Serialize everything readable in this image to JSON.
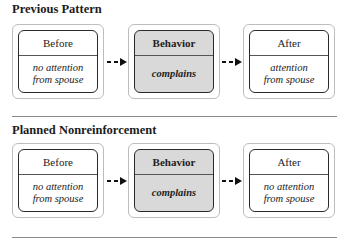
{
  "sections": [
    {
      "title": "Previous Pattern",
      "boxes": [
        {
          "header": "Before",
          "content": "no attention\nfrom spouse"
        },
        {
          "header": "Behavior",
          "content": "complains"
        },
        {
          "header": "After",
          "content": "attention\nfrom spouse"
        }
      ]
    },
    {
      "title": "Planned Nonreinforcement",
      "boxes": [
        {
          "header": "Before",
          "content": "no attention\nfrom spouse"
        },
        {
          "header": "Behavior",
          "content": "complains"
        },
        {
          "header": "After",
          "content": "no attention\nfrom spouse"
        }
      ]
    }
  ],
  "colors": {
    "behavior_fill": "#d9d9d9",
    "box_border": "#2a2a2a",
    "divider": "#8a8a8a"
  },
  "icons": {
    "connector": "dashed-arrow-right-icon"
  }
}
